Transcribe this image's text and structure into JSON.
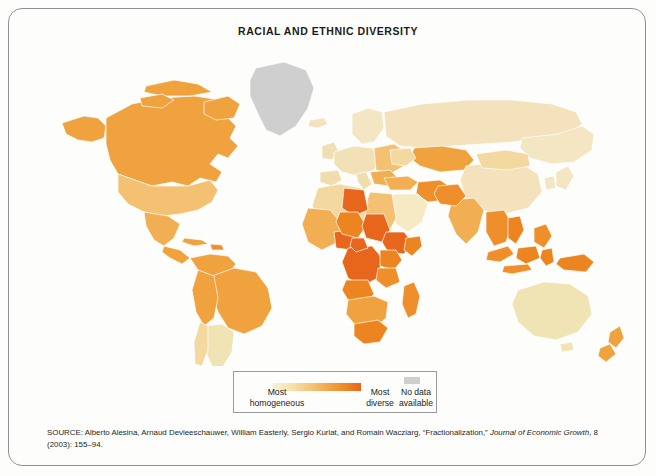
{
  "page": {
    "title": "RACIAL AND ETHNIC DIVERSITY",
    "background_color": "#fdfdfb",
    "frame_color": "#8d9196"
  },
  "map": {
    "type": "choropleth-world",
    "projection": "equirectangular-ish",
    "ocean_color": "#ffffff",
    "border_color": "#ffffff",
    "scale_colors": [
      "#f6eac4",
      "#f7dc9e",
      "#f4c173",
      "#f0a23f",
      "#ec8420",
      "#e8651c"
    ],
    "no_data_color": "#cfcfcf",
    "regions": [
      {
        "name": "Canada",
        "level": 4
      },
      {
        "name": "United States",
        "level": 3
      },
      {
        "name": "Alaska",
        "level": 3
      },
      {
        "name": "Greenland",
        "level": "no-data"
      },
      {
        "name": "Mexico",
        "level": 3
      },
      {
        "name": "Central America",
        "level": 3
      },
      {
        "name": "Cuba",
        "level": 3
      },
      {
        "name": "Brazil",
        "level": 4
      },
      {
        "name": "Colombia",
        "level": 4
      },
      {
        "name": "Venezuela",
        "level": 4
      },
      {
        "name": "Peru",
        "level": 4
      },
      {
        "name": "Bolivia",
        "level": 4
      },
      {
        "name": "Argentina",
        "level": 1
      },
      {
        "name": "Chile",
        "level": 2
      },
      {
        "name": "Western Europe",
        "level": 1
      },
      {
        "name": "Scandinavia",
        "level": 1
      },
      {
        "name": "Russia",
        "level": 2
      },
      {
        "name": "Kazakhstan",
        "level": 4
      },
      {
        "name": "China",
        "level": 1
      },
      {
        "name": "Mongolia",
        "level": 2
      },
      {
        "name": "India",
        "level": 3
      },
      {
        "name": "Pakistan",
        "level": 4
      },
      {
        "name": "Afghanistan",
        "level": 4
      },
      {
        "name": "Iran",
        "level": 4
      },
      {
        "name": "Saudi Arabia",
        "level": 1
      },
      {
        "name": "Japan",
        "level": 1
      },
      {
        "name": "Southeast Asia",
        "level": 3
      },
      {
        "name": "Indonesia",
        "level": 4
      },
      {
        "name": "Papua New Guinea",
        "level": 5
      },
      {
        "name": "Australia",
        "level": 1
      },
      {
        "name": "New Zealand",
        "level": 3
      },
      {
        "name": "North Africa",
        "level": 3
      },
      {
        "name": "Libya",
        "level": 5
      },
      {
        "name": "Chad",
        "level": 5
      },
      {
        "name": "Sudan",
        "level": 5
      },
      {
        "name": "Ethiopia",
        "level": 5
      },
      {
        "name": "Kenya",
        "level": 5
      },
      {
        "name": "DR Congo",
        "level": 5
      },
      {
        "name": "Nigeria",
        "level": 5
      },
      {
        "name": "Cameroon",
        "level": 5
      },
      {
        "name": "Tanzania",
        "level": 5
      },
      {
        "name": "South Africa",
        "level": 5
      },
      {
        "name": "Madagascar",
        "level": 4
      }
    ]
  },
  "legend": {
    "homogeneous_label": "Most\nhomogeneous",
    "homogeneous_line1": "Most",
    "homogeneous_line2": "homogeneous",
    "diverse_line1": "Most",
    "diverse_line2": "diverse",
    "nodata_line1": "No data",
    "nodata_line2": "available",
    "gradient_start": "#f7ecc8",
    "gradient_end": "#e8651c",
    "nodata_swatch": "#cfcfcf"
  },
  "source": {
    "prefix": "SOURCE: Alberto Alesina, Arnaud Devleeschauwer, William Easterly, Sergio Kurlat, and Romain Wacziarg, “Fractionalization,” ",
    "journal": "Journal of Economic Growth",
    "suffix": ", 8 (2003): 155–94."
  }
}
